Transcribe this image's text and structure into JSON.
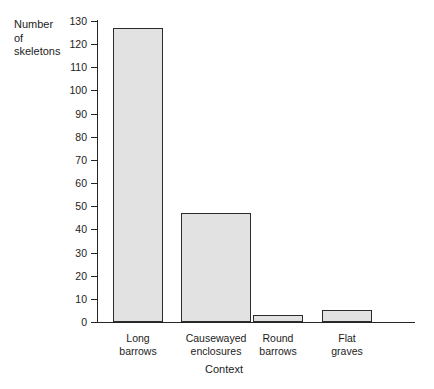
{
  "chart_data": {
    "type": "bar",
    "title": "",
    "xlabel": "Context",
    "ylabel": "Number\nof\nskeletons",
    "categories": [
      "Long\nbarrows",
      "Causewayed\nenclosures",
      "Round\nbarrows",
      "Flat\ngraves"
    ],
    "values": [
      127,
      47,
      3,
      5
    ],
    "ylim": [
      0,
      130
    ],
    "ytick_values": [
      0,
      10,
      20,
      30,
      40,
      50,
      60,
      70,
      80,
      90,
      100,
      110,
      120,
      130
    ],
    "ytick_labels": [
      "0",
      "10",
      "20",
      "30",
      "40",
      "50",
      "60",
      "70",
      "80",
      "90",
      "100",
      "110",
      "120",
      "130"
    ],
    "grid": false,
    "legend": null,
    "bar_fill_color": "#e2e2e2",
    "bar_edge_color": "#2b2b2b",
    "axis_color": "#262626",
    "background_color": "#ffffff"
  }
}
